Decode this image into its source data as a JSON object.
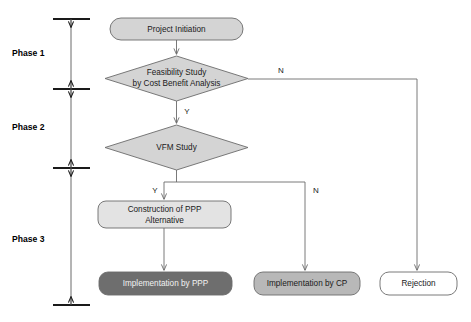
{
  "diagram": {
    "type": "flowchart",
    "colors": {
      "fill_light": "#d4d4d4",
      "fill_lighter": "#e3e3e3",
      "fill_dark": "#6e6e6e",
      "fill_white": "#ffffff",
      "stroke": "#6b6b6b",
      "text_dark": "#1a1a1a",
      "text_light": "#f2f2f2",
      "axis": "#1a1a1a"
    }
  },
  "phases": [
    {
      "id": "phase-1",
      "label": "Phase 1"
    },
    {
      "id": "phase-2",
      "label": "Phase 2"
    },
    {
      "id": "phase-3",
      "label": "Phase 3"
    }
  ],
  "nodes": {
    "project_initiation": {
      "label": "Project Initiation",
      "shape": "rounded-rectangle",
      "fill": "#d4d4d4"
    },
    "feasibility_study": {
      "label_line1": "Feasibility Study",
      "label_line2": "by Cost Benefit Analysis",
      "shape": "diamond",
      "fill": "#d4d4d4"
    },
    "vfm_study": {
      "label": "VFM Study",
      "shape": "diamond",
      "fill": "#d4d4d4"
    },
    "construction_ppp": {
      "label_line1": "Construction of PPP",
      "label_line2": "Alternative",
      "shape": "rounded-rectangle",
      "fill": "#e3e3e3"
    },
    "implementation_ppp": {
      "label": "Implementation by PPP",
      "shape": "rounded-rectangle",
      "fill": "#6e6e6e"
    },
    "implementation_cp": {
      "label": "Implementation by CP",
      "shape": "rounded-rectangle",
      "fill": "#b8b8b8"
    },
    "rejection": {
      "label": "Rejection",
      "shape": "rounded-rectangle",
      "fill": "#ffffff"
    }
  },
  "branch_labels": {
    "feasibility_no": "N",
    "feasibility_yes": "Y",
    "vfm_yes": "Y",
    "vfm_no": "N"
  }
}
